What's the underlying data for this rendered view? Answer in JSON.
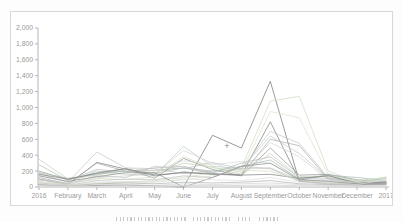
{
  "chart_data": {
    "type": "line",
    "title": "",
    "xlabel": "",
    "ylabel": "",
    "legend": "none",
    "grid": false,
    "ylim": [
      0,
      2000
    ],
    "y_tick_step": 200,
    "y_ticks": [
      0,
      200,
      400,
      600,
      800,
      1000,
      1200,
      1400,
      1600,
      1800,
      2000
    ],
    "categories": [
      "2016",
      "February",
      "March",
      "April",
      "May",
      "June",
      "July",
      "August",
      "September",
      "October",
      "November",
      "December",
      "2017"
    ],
    "axis_color": "#b5b5b5",
    "label_color": "#9a9a9a",
    "cursor_marker": {
      "glyph": "+",
      "x_index": 6.5,
      "value": 510,
      "color": "#8a8a8a"
    },
    "series": [
      {
        "name": "series-01",
        "color": "#75756a",
        "values": [
          30,
          10,
          20,
          25,
          15,
          0,
          650,
          490,
          1330,
          70,
          40,
          30,
          35
        ]
      },
      {
        "name": "series-02",
        "color": "#7d7d7d",
        "values": [
          100,
          30,
          310,
          225,
          140,
          190,
          160,
          150,
          820,
          85,
          150,
          45,
          50
        ]
      },
      {
        "name": "series-03",
        "color": "#ccdcc0",
        "values": [
          40,
          20,
          50,
          60,
          80,
          120,
          180,
          240,
          1080,
          1140,
          200,
          60,
          90
        ]
      },
      {
        "name": "series-04",
        "color": "#d8e4cc",
        "values": [
          30,
          10,
          40,
          55,
          65,
          90,
          140,
          200,
          950,
          870,
          160,
          50,
          110
        ]
      },
      {
        "name": "series-05",
        "color": "#c6c6c6",
        "values": [
          170,
          60,
          440,
          240,
          230,
          170,
          200,
          220,
          700,
          550,
          120,
          60,
          50
        ]
      },
      {
        "name": "series-06",
        "color": "#ababab",
        "values": [
          120,
          40,
          300,
          200,
          210,
          240,
          170,
          150,
          600,
          520,
          100,
          50,
          40
        ]
      },
      {
        "name": "series-07",
        "color": "#bccec6",
        "values": [
          90,
          50,
          200,
          160,
          150,
          510,
          260,
          230,
          640,
          420,
          110,
          70,
          60
        ]
      },
      {
        "name": "series-08",
        "color": "#d2d2d2",
        "values": [
          60,
          30,
          120,
          140,
          160,
          460,
          300,
          180,
          560,
          380,
          90,
          40,
          70
        ]
      },
      {
        "name": "series-09",
        "color": "#959595",
        "values": [
          200,
          90,
          180,
          230,
          110,
          360,
          220,
          140,
          490,
          150,
          160,
          90,
          60
        ]
      },
      {
        "name": "series-10",
        "color": "#c2d2b4",
        "values": [
          350,
          100,
          150,
          220,
          180,
          300,
          250,
          160,
          420,
          130,
          140,
          80,
          120
        ]
      },
      {
        "name": "series-11",
        "color": "#b8b8b8",
        "values": [
          280,
          80,
          220,
          190,
          240,
          260,
          180,
          300,
          380,
          120,
          110,
          60,
          50
        ]
      },
      {
        "name": "series-12",
        "color": "#dadada",
        "values": [
          150,
          60,
          90,
          240,
          200,
          330,
          280,
          320,
          300,
          110,
          90,
          70,
          60
        ]
      },
      {
        "name": "series-13",
        "color": "#a4bcb4",
        "values": [
          180,
          110,
          160,
          200,
          170,
          240,
          200,
          260,
          340,
          100,
          150,
          120,
          80
        ]
      },
      {
        "name": "series-14",
        "color": "#818181",
        "values": [
          160,
          100,
          170,
          230,
          150,
          180,
          165,
          150,
          160,
          110,
          140,
          50,
          60
        ]
      },
      {
        "name": "series-15",
        "color": "#c4c4c4",
        "values": [
          90,
          40,
          140,
          120,
          260,
          230,
          310,
          230,
          240,
          90,
          80,
          60,
          110
        ]
      },
      {
        "name": "series-16",
        "color": "#d0e0c2",
        "values": [
          70,
          30,
          110,
          90,
          130,
          380,
          240,
          210,
          200,
          80,
          60,
          50,
          130
        ]
      },
      {
        "name": "series-17",
        "color": "#bfbfbf",
        "values": [
          50,
          20,
          80,
          100,
          90,
          140,
          120,
          260,
          230,
          70,
          50,
          40,
          40
        ]
      },
      {
        "name": "series-18",
        "color": "#8e8e8e",
        "values": [
          140,
          70,
          130,
          180,
          180,
          0,
          120,
          260,
          300,
          90,
          70,
          40,
          50
        ]
      },
      {
        "name": "series-19",
        "color": "#dedede",
        "values": [
          40,
          15,
          60,
          70,
          60,
          100,
          90,
          80,
          120,
          60,
          40,
          30,
          90
        ]
      },
      {
        "name": "series-20",
        "color": "#b0b0b0",
        "values": [
          30,
          10,
          40,
          50,
          40,
          60,
          50,
          60,
          80,
          40,
          30,
          20,
          30
        ]
      },
      {
        "name": "series-21",
        "color": "#d4d4d4",
        "values": [
          20,
          5,
          30,
          30,
          20,
          40,
          30,
          40,
          50,
          30,
          20,
          10,
          20
        ]
      },
      {
        "name": "series-22",
        "color": "#cccccc",
        "values": [
          10,
          5,
          10,
          15,
          10,
          20,
          15,
          20,
          25,
          15,
          10,
          5,
          10
        ]
      },
      {
        "name": "series-23",
        "color": "#e2e2e2",
        "values": [
          5,
          2,
          5,
          8,
          5,
          10,
          8,
          10,
          12,
          8,
          5,
          2,
          5
        ]
      }
    ]
  }
}
